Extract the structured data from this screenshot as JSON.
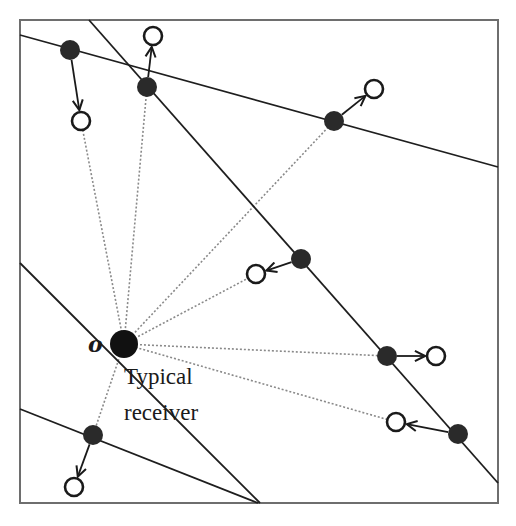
{
  "labels": {
    "origin": "o",
    "receiver_line1": "Typical",
    "receiver_line2": "receiver"
  },
  "colors": {
    "frame": "#6e6e6e",
    "line": "#1e1e1e",
    "dotted": "#8a8a8a",
    "node_fill": "#2a2a2a",
    "receiver_fill": "#111111",
    "open_stroke": "#1a1a1a"
  },
  "frame": {
    "x": 20,
    "y": 20,
    "width": 478,
    "height": 483
  },
  "typical_receiver": {
    "x": 124,
    "y": 344,
    "r": 14
  },
  "lines": [
    {
      "x1": 20,
      "y1": 35,
      "x2": 498,
      "y2": 167
    },
    {
      "x1": 89,
      "y1": 20,
      "x2": 498,
      "y2": 483
    },
    {
      "x1": 20,
      "y1": 263,
      "x2": 260,
      "y2": 503
    },
    {
      "x1": 20,
      "y1": 409,
      "x2": 258,
      "y2": 503
    }
  ],
  "pairs": [
    {
      "tx": {
        "x": 70,
        "y": 50
      },
      "rx": {
        "x": 81,
        "y": 121
      },
      "dotted_to": "rx"
    },
    {
      "tx": {
        "x": 147,
        "y": 87
      },
      "rx": {
        "x": 153,
        "y": 36
      },
      "dotted_to": "tx"
    },
    {
      "tx": {
        "x": 334,
        "y": 121
      },
      "rx": {
        "x": 374,
        "y": 89
      },
      "dotted_to": "tx"
    },
    {
      "tx": {
        "x": 301,
        "y": 259
      },
      "rx": {
        "x": 256,
        "y": 274
      },
      "dotted_to": "rx"
    },
    {
      "tx": {
        "x": 387,
        "y": 356
      },
      "rx": {
        "x": 436,
        "y": 356
      },
      "dotted_to": "tx"
    },
    {
      "tx": {
        "x": 458,
        "y": 434
      },
      "rx": {
        "x": 396,
        "y": 422
      },
      "dotted_to": "rx"
    },
    {
      "tx": {
        "x": 93,
        "y": 435
      },
      "rx": {
        "x": 74,
        "y": 487
      },
      "dotted_to": "tx"
    }
  ]
}
